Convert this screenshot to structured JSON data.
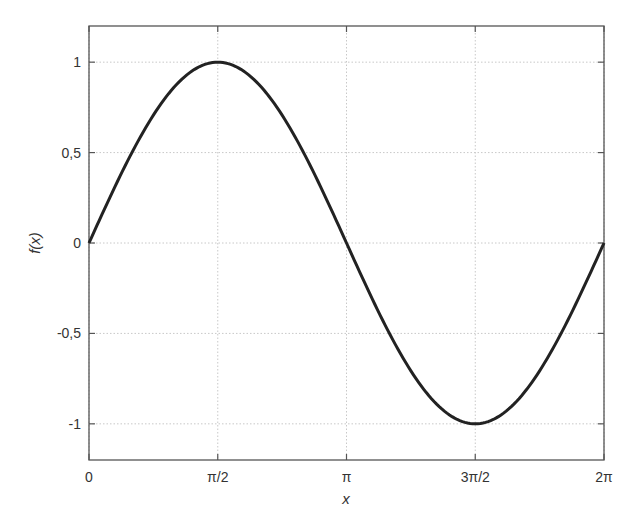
{
  "chart_data": {
    "type": "line",
    "title": "",
    "xlabel": "x",
    "ylabel": "f(x)",
    "xlim": [
      0,
      6.2832
    ],
    "ylim": [
      -1.2,
      1.2
    ],
    "grid": true,
    "legend": null,
    "x_ticks": [
      {
        "value": 0,
        "label": "0"
      },
      {
        "value": 1.5708,
        "label": "π/2"
      },
      {
        "value": 3.1416,
        "label": "π"
      },
      {
        "value": 4.7124,
        "label": "3π/2"
      },
      {
        "value": 6.2832,
        "label": "2π"
      }
    ],
    "y_ticks": [
      {
        "value": 1,
        "label": "1"
      },
      {
        "value": 0.5,
        "label": "0,5"
      },
      {
        "value": 0,
        "label": "0"
      },
      {
        "value": -0.5,
        "label": "-0,5"
      },
      {
        "value": -1,
        "label": "-1"
      }
    ],
    "series": [
      {
        "name": "sin(x)",
        "function": "sin",
        "x": [
          0,
          0.7854,
          1.5708,
          2.3562,
          3.1416,
          3.927,
          4.7124,
          5.4978,
          6.2832
        ],
        "y": [
          0,
          0.7071,
          1,
          0.7071,
          0,
          -0.7071,
          -1,
          -0.7071,
          0
        ],
        "color": "#222222"
      }
    ]
  }
}
